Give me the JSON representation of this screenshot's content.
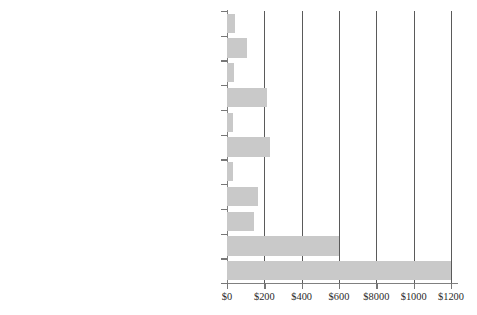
{
  "chart_data": {
    "type": "bar",
    "orientation": "horizontal",
    "title": "",
    "xlabel": "",
    "ylabel": "",
    "xlim": [
      0,
      1232
    ],
    "grid": "vertical gridlines at each x tick",
    "legend": "none",
    "bar_color": "#c9c9c9",
    "axis_color": "#808080",
    "categories": [
      "Public Health",
      "Insurance and Administration",
      "Other Health Services",
      "Nursing Home Care",
      "Vision Products and other nondurables",
      "Drugs and other nondurables",
      "Home Health Care",
      "Other Professional Services",
      "Dentists' Services",
      "Physicians' Services",
      "Hospital Care"
    ],
    "values": [
      45,
      105,
      35,
      215,
      30,
      230,
      30,
      165,
      145,
      600,
      1200
    ],
    "xticks": [
      0,
      200,
      400,
      600,
      800,
      1000,
      1200
    ],
    "xticklabels": [
      "$0",
      "$200",
      "$400",
      "$600",
      "$8000",
      "$1000",
      "$1200"
    ]
  }
}
